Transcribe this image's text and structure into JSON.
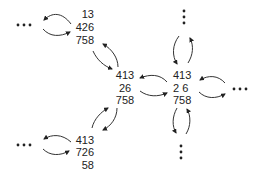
{
  "diagram": {
    "nodes": [
      {
        "id": "top-left",
        "lines": [
          "13",
          "426",
          "758"
        ],
        "align": "right"
      },
      {
        "id": "middle-left",
        "lines": [
          "413",
          "26",
          "758"
        ],
        "align": "center"
      },
      {
        "id": "right",
        "lines": [
          "413",
          "2 6",
          "758"
        ],
        "align": "left"
      },
      {
        "id": "bottom-left",
        "lines": [
          "413",
          "726",
          "58"
        ],
        "align": "right"
      }
    ],
    "ellipsis": "···",
    "colors": {
      "text": "#222222",
      "arrow": "#333333",
      "background": "#ffffff"
    }
  }
}
